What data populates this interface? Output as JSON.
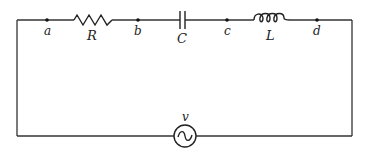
{
  "diagram": {
    "type": "series RLC circuit",
    "nodes": [
      {
        "id": "a",
        "label": "a",
        "x": 47,
        "y": 20
      },
      {
        "id": "b",
        "label": "b",
        "x": 138,
        "y": 20
      },
      {
        "id": "c",
        "label": "c",
        "x": 227,
        "y": 20
      },
      {
        "id": "d",
        "label": "d",
        "x": 317,
        "y": 20
      }
    ],
    "components": [
      {
        "id": "resistor",
        "label": "R",
        "between": [
          "a",
          "b"
        ]
      },
      {
        "id": "capacitor",
        "label": "C",
        "between": [
          "b",
          "c"
        ]
      },
      {
        "id": "inductor",
        "label": "L",
        "between": [
          "c",
          "d"
        ]
      },
      {
        "id": "source",
        "label": "v",
        "kind": "AC voltage source",
        "position": "bottom wire"
      }
    ],
    "colors": {
      "line": "#333333",
      "background": "#ffffff"
    }
  }
}
